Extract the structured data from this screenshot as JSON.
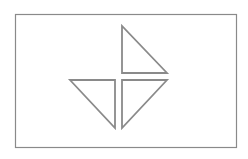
{
  "diagram": {
    "width": 248,
    "height": 159,
    "background": "#ffffff",
    "stroke_color": "#8a8a8a",
    "stroke_width": 1.2,
    "frame": {
      "x": 15.5,
      "y": 14.5,
      "width": 221,
      "height": 133
    },
    "shapes": [
      {
        "name": "triangle-top",
        "points": [
          [
            122,
            26
          ],
          [
            122,
            73
          ],
          [
            167,
            73
          ]
        ]
      },
      {
        "name": "triangle-bottom-left",
        "points": [
          [
            70,
            80
          ],
          [
            115,
            80
          ],
          [
            115,
            128
          ]
        ]
      },
      {
        "name": "triangle-bottom-right",
        "points": [
          [
            122,
            80
          ],
          [
            167,
            80
          ],
          [
            122,
            128
          ]
        ]
      }
    ]
  }
}
